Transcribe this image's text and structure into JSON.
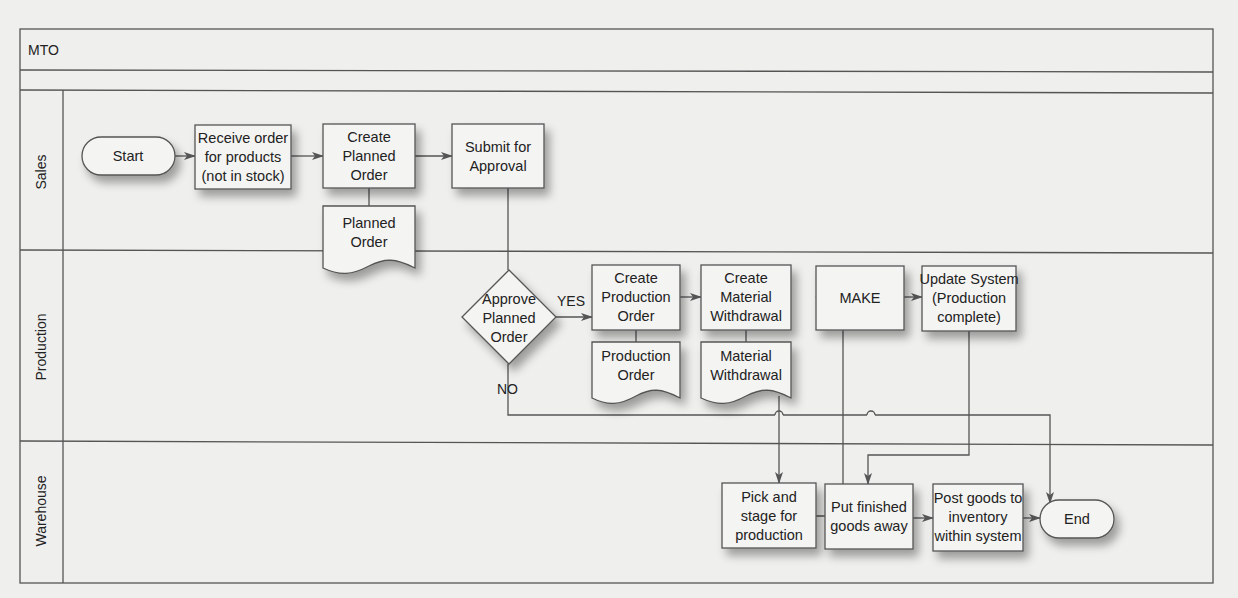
{
  "diagram": {
    "title": "MTO",
    "lanes": [
      {
        "id": "sales",
        "label": "Sales"
      },
      {
        "id": "production",
        "label": "Production"
      },
      {
        "id": "warehouse",
        "label": "Warehouse"
      }
    ],
    "nodes": {
      "start": {
        "type": "terminator",
        "lane": "sales",
        "lines": [
          "Start"
        ]
      },
      "receive_order": {
        "type": "process",
        "lane": "sales",
        "lines": [
          "Receive order",
          "for products",
          "(not in stock)"
        ]
      },
      "create_planned_order": {
        "type": "process",
        "lane": "sales",
        "lines": [
          "Create",
          "Planned",
          "Order"
        ]
      },
      "submit_for_approval": {
        "type": "process",
        "lane": "sales",
        "lines": [
          "Submit for",
          "Approval"
        ]
      },
      "planned_order_doc": {
        "type": "document",
        "lane": "sales",
        "lines": [
          "Planned",
          "Order"
        ]
      },
      "approve_planned_order": {
        "type": "decision",
        "lane": "production",
        "lines": [
          "Approve",
          "Planned",
          "Order"
        ]
      },
      "create_production_order": {
        "type": "process",
        "lane": "production",
        "lines": [
          "Create",
          "Production",
          "Order"
        ]
      },
      "production_order_doc": {
        "type": "document",
        "lane": "production",
        "lines": [
          "Production",
          "Order"
        ]
      },
      "create_material_withdrawal": {
        "type": "process",
        "lane": "production",
        "lines": [
          "Create",
          "Material",
          "Withdrawal"
        ]
      },
      "material_withdrawal_doc": {
        "type": "document",
        "lane": "production",
        "lines": [
          "Material",
          "Withdrawal"
        ]
      },
      "make": {
        "type": "process",
        "lane": "production",
        "lines": [
          "MAKE"
        ]
      },
      "update_system": {
        "type": "process",
        "lane": "production",
        "lines": [
          "Update System",
          "(Production",
          "complete)"
        ]
      },
      "pick_and_stage": {
        "type": "process",
        "lane": "warehouse",
        "lines": [
          "Pick and",
          "stage for",
          "production"
        ]
      },
      "put_finished_goods": {
        "type": "process",
        "lane": "warehouse",
        "lines": [
          "Put finished",
          "goods away"
        ]
      },
      "post_goods": {
        "type": "process",
        "lane": "warehouse",
        "lines": [
          "Post goods to",
          "inventory",
          "within system"
        ]
      },
      "end": {
        "type": "terminator",
        "lane": "warehouse",
        "lines": [
          "End"
        ]
      }
    },
    "edge_labels": {
      "yes": "YES",
      "no": "NO"
    },
    "edges": [
      {
        "from": "start",
        "to": "receive_order"
      },
      {
        "from": "receive_order",
        "to": "create_planned_order"
      },
      {
        "from": "create_planned_order",
        "to": "submit_for_approval"
      },
      {
        "from": "create_planned_order",
        "to": "planned_order_doc",
        "style": "association"
      },
      {
        "from": "submit_for_approval",
        "to": "approve_planned_order"
      },
      {
        "from": "approve_planned_order",
        "to": "create_production_order",
        "label": "YES"
      },
      {
        "from": "approve_planned_order",
        "to": "end",
        "label": "NO"
      },
      {
        "from": "create_production_order",
        "to": "production_order_doc",
        "style": "association"
      },
      {
        "from": "create_production_order",
        "to": "create_material_withdrawal"
      },
      {
        "from": "create_material_withdrawal",
        "to": "material_withdrawal_doc",
        "style": "association"
      },
      {
        "from": "material_withdrawal_doc",
        "to": "pick_and_stage"
      },
      {
        "from": "pick_and_stage",
        "to": "make"
      },
      {
        "from": "make",
        "to": "update_system"
      },
      {
        "from": "update_system",
        "to": "put_finished_goods"
      },
      {
        "from": "put_finished_goods",
        "to": "post_goods"
      },
      {
        "from": "post_goods",
        "to": "end"
      }
    ],
    "colors": {
      "line": "#555555",
      "box_fill": "#f4f4f2",
      "page": "#efefed",
      "text": "#222222"
    }
  }
}
